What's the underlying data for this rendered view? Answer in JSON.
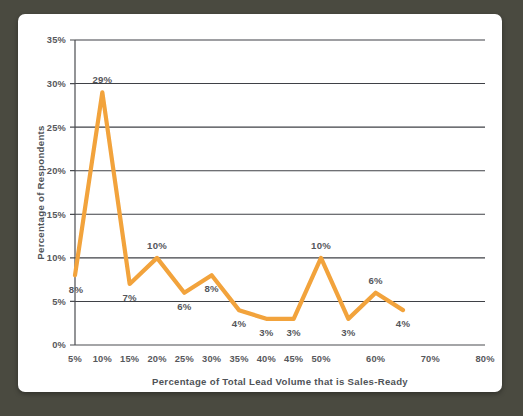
{
  "frame": {
    "background_color": "#4a4a40",
    "card_color": "#ffffff"
  },
  "chart_data": {
    "type": "line",
    "title": "",
    "xlabel": "Percentage of Total Lead Volume that is Sales-Ready",
    "ylabel": "Percentage of Respondents",
    "series_color": "#f2a33c",
    "grid": true,
    "legend": "none",
    "ylim": [
      0,
      35
    ],
    "ytick_labels": [
      "0%",
      "5%",
      "10%",
      "15%",
      "20%",
      "25%",
      "30%",
      "35%"
    ],
    "ytick_values": [
      0,
      5,
      10,
      15,
      20,
      25,
      30,
      35
    ],
    "xtick_labels": [
      "5%",
      "10%",
      "15%",
      "20%",
      "25%",
      "30%",
      "35%",
      "40%",
      "45%",
      "50%",
      "60%",
      "70%",
      "80%"
    ],
    "xtick_values": [
      5,
      10,
      15,
      20,
      25,
      30,
      35,
      40,
      45,
      50,
      60,
      70,
      80
    ],
    "categories": [
      "5%",
      "10%",
      "15%",
      "20%",
      "25%",
      "30%",
      "35%",
      "40%",
      "45%",
      "50%",
      "55%",
      "60%",
      "65%"
    ],
    "x": [
      5,
      10,
      15,
      20,
      25,
      30,
      35,
      40,
      45,
      50,
      55,
      60,
      65
    ],
    "values": [
      8,
      29,
      7,
      10,
      6,
      8,
      4,
      3,
      3,
      10,
      3,
      6,
      4
    ],
    "data_labels": [
      "8%",
      "29%",
      "7%",
      "10%",
      "6%",
      "8%",
      "4%",
      "3%",
      "3%",
      "10%",
      "3%",
      "6%",
      "4%"
    ],
    "label_positions": [
      "below-left",
      "above",
      "below",
      "above",
      "below",
      "below",
      "below",
      "below",
      "below",
      "above",
      "below",
      "above",
      "below"
    ]
  }
}
